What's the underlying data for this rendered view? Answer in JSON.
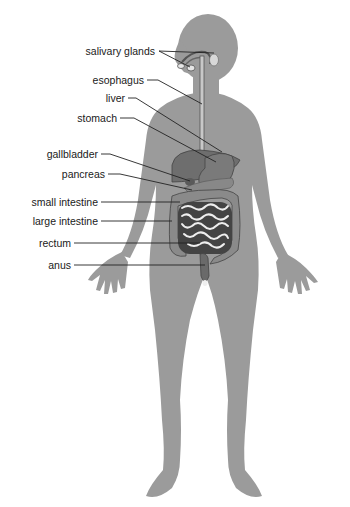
{
  "diagram": {
    "colors": {
      "body": "#9a9a9a",
      "organs_dark": "#5a5a5a",
      "organs_mid": "#7d7d7d",
      "intestine_light": "#e8e8e8",
      "leader_line": "#222222",
      "background": "#ffffff"
    },
    "labels": [
      {
        "id": "salivary-glands",
        "text": "salivary glands"
      },
      {
        "id": "esophagus",
        "text": "esophagus"
      },
      {
        "id": "liver",
        "text": "liver"
      },
      {
        "id": "stomach",
        "text": "stomach"
      },
      {
        "id": "gallbladder",
        "text": "gallbladder"
      },
      {
        "id": "pancreas",
        "text": "pancreas"
      },
      {
        "id": "small-intestine",
        "text": "small intestine"
      },
      {
        "id": "large-intestine",
        "text": "large intestine"
      },
      {
        "id": "rectum",
        "text": "rectum"
      },
      {
        "id": "anus",
        "text": "anus"
      }
    ]
  }
}
